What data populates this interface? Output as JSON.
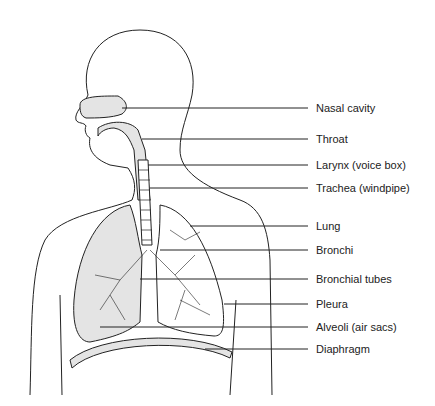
{
  "diagram": {
    "labels": [
      {
        "text": "Nasal cavity",
        "y": 108,
        "x1": 122
      },
      {
        "text": "Throat",
        "y": 139,
        "x1": 142
      },
      {
        "text": "Larynx (voice box)",
        "y": 165,
        "x1": 148
      },
      {
        "text": "Trachea (windpipe)",
        "y": 188,
        "x1": 150
      },
      {
        "text": "Lung",
        "y": 226,
        "x1": 190
      },
      {
        "text": "Bronchi",
        "y": 250,
        "x1": 160
      },
      {
        "text": "Bronchial tubes",
        "y": 279,
        "x1": 140
      },
      {
        "text": "Pleura",
        "y": 304,
        "x1": 224
      },
      {
        "text": "Alveoli (air sacs)",
        "y": 327,
        "x1": 100
      },
      {
        "text": "Diaphragm",
        "y": 349,
        "x1": 205
      }
    ],
    "colors": {
      "line": "#222222",
      "fill": "#e4e4e4",
      "background": "#ffffff"
    }
  }
}
